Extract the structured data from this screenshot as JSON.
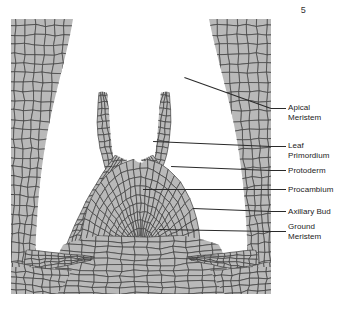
{
  "page": {
    "number": "5"
  },
  "figure": {
    "colors": {
      "cell_fill": "#b9b9b9",
      "cell_stroke": "#3c3c3c",
      "background": "#ffffff",
      "label_text": "#232323",
      "leader_line": "#2a2a2a"
    },
    "regions": [
      {
        "name": "left-young-leaf",
        "label": "Leaf Primordium"
      },
      {
        "name": "right-young-leaf",
        "label": "Leaf Primordium"
      },
      {
        "name": "left-leaf-primordium",
        "label": "Leaf Primordium"
      },
      {
        "name": "right-leaf-primordium",
        "label": "Leaf Primordium"
      },
      {
        "name": "apical-dome",
        "label": "Apical Meristem"
      },
      {
        "name": "left-axillary-bud",
        "label": "Axillary Bud"
      },
      {
        "name": "right-axillary-bud",
        "label": "Axillary Bud"
      },
      {
        "name": "stem-body",
        "label": "Ground Meristem"
      }
    ]
  },
  "labels": [
    {
      "id": "apical-meristem",
      "lines": [
        "Apical",
        "Meristem"
      ],
      "y": 103,
      "leader_y": 108,
      "leader_len": 15,
      "in_x": -92,
      "in_y": 141
    },
    {
      "id": "leaf-primordium",
      "lines": [
        "Leaf",
        "Primordium"
      ],
      "y": 141,
      "leader_y": 146,
      "leader_len": 15,
      "in_x": -118,
      "in_y": 151
    },
    {
      "id": "protoderm",
      "lines": [
        "Protoderm"
      ],
      "y": 166,
      "leader_y": 170,
      "leader_len": 15,
      "in_x": -100,
      "in_y": 174
    },
    {
      "id": "procambium",
      "lines": [
        "Procambium"
      ],
      "y": 185,
      "leader_y": 189,
      "leader_len": 15,
      "in_x": -128,
      "in_y": 189
    },
    {
      "id": "axillary-bud",
      "lines": [
        "Axillary Bud"
      ],
      "y": 207,
      "leader_y": 211,
      "leader_len": 15,
      "in_x": -78,
      "in_y": 214
    },
    {
      "id": "ground-meristem",
      "lines": [
        "Ground",
        "Meristem"
      ],
      "y": 222,
      "leader_y": 231,
      "leader_len": 15,
      "in_x": -112,
      "in_y": 233
    }
  ]
}
